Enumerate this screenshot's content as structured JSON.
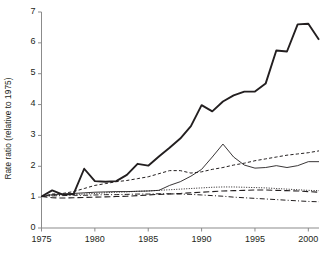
{
  "chart_data": {
    "type": "line",
    "title": "",
    "xlabel": "",
    "ylabel": "Rate ratio (relative to 1975)",
    "xlim": [
      1975,
      2001
    ],
    "ylim": [
      0,
      7
    ],
    "xticks": [
      1975,
      1980,
      1985,
      1990,
      1995,
      2000
    ],
    "yticks": [
      0,
      1,
      2,
      3,
      4,
      5,
      6,
      7
    ],
    "grid": false,
    "legend": "none",
    "x": [
      1975,
      1976,
      1977,
      1978,
      1979,
      1980,
      1981,
      1982,
      1983,
      1984,
      1985,
      1986,
      1987,
      1988,
      1989,
      1990,
      1991,
      1992,
      1993,
      1994,
      1995,
      1996,
      1997,
      1998,
      1999,
      2000,
      2001
    ],
    "series": [
      {
        "name": "series-thick-solid",
        "style": "solid",
        "width": 1.9,
        "color": "#231f20",
        "values": [
          1.02,
          1.22,
          1.08,
          1.1,
          1.92,
          1.52,
          1.5,
          1.52,
          1.72,
          2.08,
          2.02,
          2.32,
          2.6,
          2.9,
          3.3,
          3.98,
          3.78,
          4.1,
          4.3,
          4.42,
          4.42,
          4.68,
          5.75,
          5.72,
          6.6,
          6.62,
          6.1
        ]
      },
      {
        "name": "series-short-dash",
        "style": "dashed",
        "width": 1.0,
        "color": "#231f20",
        "values": [
          1.02,
          1.1,
          1.12,
          1.18,
          1.28,
          1.38,
          1.44,
          1.5,
          1.54,
          1.6,
          1.66,
          1.76,
          1.86,
          1.86,
          1.78,
          1.82,
          1.9,
          1.96,
          2.04,
          2.1,
          2.18,
          2.24,
          2.3,
          2.36,
          2.4,
          2.44,
          2.5
        ]
      },
      {
        "name": "series-thin-solid",
        "style": "solid",
        "width": 0.9,
        "color": "#231f20",
        "values": [
          1.02,
          1.08,
          1.1,
          1.12,
          1.14,
          1.16,
          1.17,
          1.18,
          1.18,
          1.19,
          1.2,
          1.22,
          1.38,
          1.5,
          1.68,
          1.9,
          2.3,
          2.72,
          2.3,
          2.04,
          1.94,
          1.96,
          2.02,
          1.96,
          2.02,
          2.15,
          2.15
        ]
      },
      {
        "name": "series-dotted",
        "style": "dotted",
        "width": 1.0,
        "color": "#231f20",
        "values": [
          1.02,
          1.06,
          1.08,
          1.09,
          1.1,
          1.12,
          1.14,
          1.16,
          1.17,
          1.19,
          1.2,
          1.22,
          1.24,
          1.26,
          1.28,
          1.3,
          1.32,
          1.33,
          1.33,
          1.32,
          1.31,
          1.3,
          1.28,
          1.26,
          1.24,
          1.22,
          1.21
        ]
      },
      {
        "name": "series-long-dash",
        "style": "long-dash",
        "width": 1.1,
        "color": "#231f20",
        "values": [
          1.02,
          0.98,
          0.97,
          0.98,
          0.99,
          1.0,
          1.01,
          1.02,
          1.03,
          1.05,
          1.07,
          1.09,
          1.1,
          1.12,
          1.14,
          1.16,
          1.18,
          1.2,
          1.21,
          1.22,
          1.23,
          1.23,
          1.22,
          1.21,
          1.2,
          1.18,
          1.16
        ]
      },
      {
        "name": "series-dash-dot",
        "style": "dash-dot",
        "width": 1.0,
        "color": "#231f20",
        "values": [
          1.02,
          1.04,
          1.05,
          1.06,
          1.06,
          1.07,
          1.08,
          1.08,
          1.09,
          1.1,
          1.1,
          1.11,
          1.11,
          1.1,
          1.09,
          1.07,
          1.05,
          1.03,
          1.0,
          0.98,
          0.96,
          0.94,
          0.92,
          0.9,
          0.88,
          0.86,
          0.85
        ]
      }
    ],
    "axis_color": "#8b8b8b",
    "text_color": "#231f20",
    "background": "#ffffff"
  }
}
